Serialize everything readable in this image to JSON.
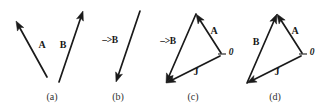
{
  "figure": {
    "width": 327,
    "height": 111,
    "background": "#ffffff",
    "ink_color": "#1a1a1a",
    "caption_color": "#303030"
  },
  "panels": [
    {
      "id": "a",
      "caption": "(a)",
      "caption_pos": {
        "x": 52,
        "y": 97
      },
      "description": "Two separate vectors A and B, not joined",
      "vectors": [
        {
          "name": "A",
          "from": {
            "x": 47,
            "y": 77
          },
          "to": {
            "x": 16,
            "y": 21
          },
          "label": "A",
          "label_pos": {
            "x": 42,
            "y": 45
          }
        },
        {
          "name": "B",
          "from": {
            "x": 59,
            "y": 82
          },
          "to": {
            "x": 83,
            "y": 11
          },
          "label": "B",
          "label_pos": {
            "x": 63,
            "y": 45
          }
        }
      ],
      "ticks": []
    },
    {
      "id": "b",
      "caption": "(b)",
      "caption_pos": {
        "x": 118,
        "y": 97
      },
      "description": "Vector B reversed, pointing down-left, labelled minus B",
      "vectors": [
        {
          "name": "-B",
          "from": {
            "x": 140,
            "y": 11
          },
          "to": {
            "x": 116,
            "y": 82
          },
          "label": "–>B",
          "label_pos": {
            "x": 110,
            "y": 41
          }
        }
      ],
      "ticks": []
    },
    {
      "id": "c",
      "caption": "(c)",
      "caption_pos": {
        "x": 193,
        "y": 97
      },
      "description": "Triangle of vectors: minus B, A and J meeting at origin 0",
      "vectors": [
        {
          "name": "-B",
          "from": {
            "x": 196,
            "y": 14
          },
          "to": {
            "x": 166,
            "y": 83
          },
          "label": "–>B",
          "label_pos": {
            "x": 168,
            "y": 42
          }
        },
        {
          "name": "A",
          "from": {
            "x": 221,
            "y": 53
          },
          "to": {
            "x": 196,
            "y": 14
          },
          "label": "A",
          "label_pos": {
            "x": 214,
            "y": 31
          }
        },
        {
          "name": "J",
          "from": {
            "x": 220,
            "y": 56
          },
          "to": {
            "x": 166,
            "y": 83
          },
          "label": "J",
          "label_pos": {
            "x": 196,
            "y": 72
          }
        }
      ],
      "ticks": [
        {
          "from": {
            "x": 218,
            "y": 54
          },
          "to": {
            "x": 226,
            "y": 54
          }
        }
      ],
      "origin": {
        "label": "0",
        "pos": {
          "x": 231,
          "y": 53
        }
      }
    },
    {
      "id": "d",
      "caption": "(d)",
      "caption_pos": {
        "x": 275,
        "y": 97
      },
      "description": "Triangle of vectors: B, A and J meeting at origin 0",
      "vectors": [
        {
          "name": "B",
          "from": {
            "x": 247,
            "y": 83
          },
          "to": {
            "x": 277,
            "y": 14
          },
          "label": "B",
          "label_pos": {
            "x": 256,
            "y": 42
          }
        },
        {
          "name": "A",
          "from": {
            "x": 302,
            "y": 53
          },
          "to": {
            "x": 277,
            "y": 14
          },
          "label": "A",
          "label_pos": {
            "x": 295,
            "y": 31
          }
        },
        {
          "name": "J",
          "from": {
            "x": 301,
            "y": 56
          },
          "to": {
            "x": 247,
            "y": 83
          },
          "label": "J",
          "label_pos": {
            "x": 277,
            "y": 72
          }
        }
      ],
      "ticks": [
        {
          "from": {
            "x": 299,
            "y": 54
          },
          "to": {
            "x": 307,
            "y": 54
          }
        }
      ],
      "origin": {
        "label": "0",
        "pos": {
          "x": 312,
          "y": 53
        }
      }
    }
  ]
}
